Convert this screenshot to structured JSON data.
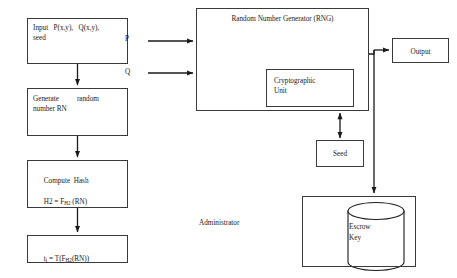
{
  "diagram": {
    "background": "#ffffff",
    "stroke": "#3a3a3a",
    "text_color": "#1a1a1a",
    "width": 457,
    "height": 278
  },
  "flow_left": {
    "input": "Input   P(x,y),   Q(x,y),\nseed",
    "generate": "Generate          random\nnumber RN",
    "hash_line1": "Compute  Hash",
    "hash_line2_prefix": "H2 = F",
    "hash_line2_sub": "H2",
    "hash_line2_suffix": " (RN)",
    "ti_prefix": "t",
    "ti_sub1": "i",
    "ti_mid": " = T(F",
    "ti_sub2": "H2",
    "ti_suffix": "(RN))"
  },
  "rng": {
    "title": "Random Number Generator (RNG)",
    "crypto_unit": "Cryptographic\nUnit",
    "seed": "Seed",
    "input_p": "P",
    "input_q": "Q"
  },
  "right": {
    "output": "Output",
    "administrator": "Administrator",
    "escrow_key": "Escrow\nKey"
  },
  "edges": [
    {
      "name": "input-to-generate",
      "from": "box-input",
      "to": "box-generate",
      "arrow": "single"
    },
    {
      "name": "generate-to-hash",
      "from": "box-generate",
      "to": "box-hash",
      "arrow": "single"
    },
    {
      "name": "hash-to-ti",
      "from": "box-hash",
      "to": "box-ti",
      "arrow": "single"
    },
    {
      "name": "p-to-rng",
      "from": "input_p",
      "to": "box-rng",
      "arrow": "single"
    },
    {
      "name": "q-to-rng",
      "from": "input_q",
      "to": "box-rng",
      "arrow": "single"
    },
    {
      "name": "rng-to-seed",
      "from": "box-rng",
      "to": "box-seed",
      "arrow": "double"
    },
    {
      "name": "rng-to-output",
      "from": "box-rng",
      "to": "box-output",
      "arrow": "single"
    },
    {
      "name": "rng-to-escrow",
      "from": "box-rng",
      "to": "box-escrow",
      "arrow": "single"
    }
  ]
}
